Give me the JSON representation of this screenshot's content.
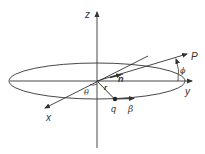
{
  "diagram": {
    "title": "",
    "colors": {
      "stroke": "#333333",
      "background": "#ffffff"
    },
    "axes": {
      "z": {
        "label": "z"
      },
      "y": {
        "label": "y"
      },
      "x": {
        "label": "x"
      }
    },
    "labels": {
      "P": "P",
      "phi": "ϕ",
      "n_hat": "n̂",
      "r": "r",
      "theta": "θ",
      "q": "q",
      "beta": "β"
    }
  }
}
